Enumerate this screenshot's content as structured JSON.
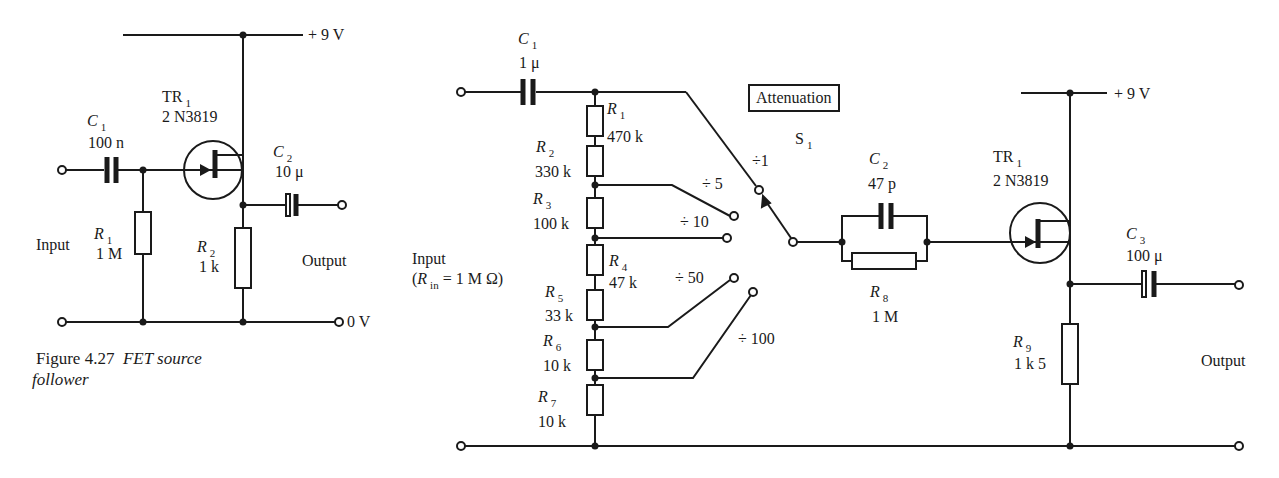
{
  "figure_left": {
    "caption_number": "Figure 4.27",
    "caption_title": "FET source",
    "caption_title_2": "follower",
    "supply": "+ 9 V",
    "ground": "0 V",
    "input_label": "Input",
    "output_label": "Output",
    "tr1": {
      "name": "TR",
      "sub": "1",
      "part": "2 N3819"
    },
    "c1": {
      "name": "C",
      "sub": "1",
      "value": "100 n"
    },
    "c2": {
      "name": "C",
      "sub": "2",
      "value": "10 μ"
    },
    "r1": {
      "name": "R",
      "sub": "1",
      "value": "1 M"
    },
    "r2": {
      "name": "R",
      "sub": "2",
      "value": "1 k"
    }
  },
  "figure_right": {
    "supply": "+ 9 V",
    "input_label": "Input",
    "input_rin_open": "(",
    "input_rin_name": "R",
    "input_rin_sub": "in",
    "input_rin_value": "= 1 M Ω)",
    "output_label": "Output",
    "attenuation_label": "Attenuation",
    "switch": {
      "name": "S",
      "sub": "1"
    },
    "tr1": {
      "name": "TR",
      "sub": "1",
      "part": "2 N3819"
    },
    "c1": {
      "name": "C",
      "sub": "1",
      "value": "1 μ"
    },
    "c2": {
      "name": "C",
      "sub": "2",
      "value": "47 p"
    },
    "c3": {
      "name": "C",
      "sub": "3",
      "value": "100 μ"
    },
    "r1": {
      "name": "R",
      "sub": "1",
      "value": "470 k"
    },
    "r2": {
      "name": "R",
      "sub": "2",
      "value": "330 k"
    },
    "r3": {
      "name": "R",
      "sub": "3",
      "value": "100 k"
    },
    "r4": {
      "name": "R",
      "sub": "4",
      "value": "47 k"
    },
    "r5": {
      "name": "R",
      "sub": "5",
      "value": "33 k"
    },
    "r6": {
      "name": "R",
      "sub": "6",
      "value": "10 k"
    },
    "r7": {
      "name": "R",
      "sub": "7",
      "value": "10 k"
    },
    "r8": {
      "name": "R",
      "sub": "8",
      "value": "1 M"
    },
    "r9": {
      "name": "R",
      "sub": "9",
      "value": "1 k 5"
    },
    "ratios": [
      "÷1",
      "÷ 5",
      "÷ 10",
      "÷ 50",
      "÷ 100"
    ]
  }
}
